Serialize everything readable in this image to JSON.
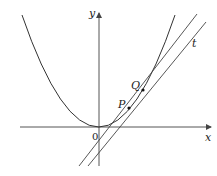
{
  "diagram": {
    "type": "tangent-secant-parabola",
    "labels": {
      "y_axis": "y",
      "x_axis": "x",
      "origin": "0",
      "point_p": "P",
      "point_q": "Q",
      "tangent": "t"
    },
    "colors": {
      "curve": "#333333",
      "axes": "#555555",
      "lines": "#444444",
      "points": "#111111"
    }
  }
}
